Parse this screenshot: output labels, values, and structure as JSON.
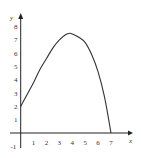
{
  "chart_data": {
    "type": "line",
    "title": "",
    "xlabel": "x",
    "ylabel": "y",
    "xlim": [
      -0.5,
      8
    ],
    "ylim": [
      -1,
      8.7
    ],
    "grid": false,
    "legend": null,
    "x_ticks": [
      "1",
      "2",
      "3",
      "4",
      "5",
      "6",
      "7"
    ],
    "y_ticks": [
      "-1",
      "1",
      "2",
      "3",
      "4",
      "5",
      "6",
      "7",
      "8"
    ],
    "series": [
      {
        "name": "f(x)",
        "x": [
          0,
          0.5,
          1,
          1.5,
          2,
          2.5,
          3,
          3.5,
          3.8,
          4,
          4.5,
          5,
          5.5,
          6,
          6.5,
          7
        ],
        "y": [
          2,
          2.9,
          3.8,
          4.8,
          5.6,
          6.4,
          7.0,
          7.4,
          7.5,
          7.45,
          7.2,
          6.8,
          5.9,
          4.6,
          2.7,
          0
        ]
      }
    ],
    "colors": {
      "curve": "#333333",
      "axes": "#222222",
      "background": "#ffffff"
    }
  }
}
